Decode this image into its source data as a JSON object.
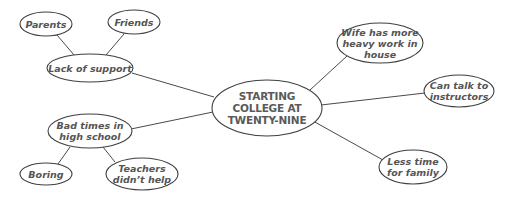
{
  "diagram": {
    "type": "cluster-map",
    "center": {
      "id": "center",
      "label": "STARTING\nCOLLEGE AT\nTWENTY-NINE"
    },
    "nodes": [
      {
        "id": "parents",
        "label": "Parents"
      },
      {
        "id": "friends",
        "label": "Friends"
      },
      {
        "id": "lack",
        "label": "Lack of support"
      },
      {
        "id": "badtimes",
        "label": "Bad times in\nhigh school"
      },
      {
        "id": "boring",
        "label": "Boring"
      },
      {
        "id": "teachers",
        "label": "Teachers\ndidn’t help"
      },
      {
        "id": "wife",
        "label": "Wife has more\nheavy work in\nhouse"
      },
      {
        "id": "cantalk",
        "label": "Can talk to\ninstructors"
      },
      {
        "id": "lesstime",
        "label": "Less time\nfor family"
      }
    ],
    "edges": [
      [
        "parents",
        "lack"
      ],
      [
        "friends",
        "lack"
      ],
      [
        "lack",
        "center"
      ],
      [
        "badtimes",
        "center"
      ],
      [
        "badtimes",
        "boring"
      ],
      [
        "badtimes",
        "teachers"
      ],
      [
        "center",
        "wife"
      ],
      [
        "center",
        "cantalk"
      ],
      [
        "center",
        "lesstime"
      ]
    ],
    "colors": {
      "stroke": "#3f3f3f",
      "text": "#555555",
      "background": "#ffffff"
    }
  }
}
